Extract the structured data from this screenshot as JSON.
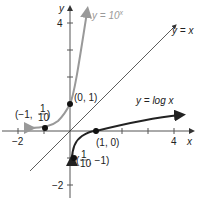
{
  "axes": {
    "x_label": "x",
    "y_label": "y",
    "x_ticks": [
      {
        "value": -2,
        "label": "−2"
      },
      {
        "value": 4,
        "label": "4"
      }
    ],
    "y_ticks": [
      {
        "value": 4,
        "label": "4"
      },
      {
        "value": -2,
        "label": "−2"
      }
    ],
    "xlim": [
      -2.5,
      5
    ],
    "ylim": [
      -2.5,
      4.6
    ]
  },
  "curves": [
    {
      "name": "exponential",
      "label": "y = 10^x",
      "label_base": "y = 10",
      "label_exp": "x",
      "color": "#999999"
    },
    {
      "name": "identity",
      "label": "y = x",
      "color": "#333333"
    },
    {
      "name": "logarithm",
      "label": "y = log x",
      "color": "#222222"
    }
  ],
  "points": [
    {
      "name": "exp-point-0-1",
      "label": "(0, 1)",
      "x": 0,
      "y": 1
    },
    {
      "name": "exp-point-neg1",
      "label_pre": "(−1,",
      "num": "1",
      "den": "10",
      "label_post": ")",
      "x": -1,
      "y": 0.1
    },
    {
      "name": "log-point-1-0",
      "label": "(1, 0)",
      "x": 1,
      "y": 0
    },
    {
      "name": "log-point-tenth",
      "label_pre": "(",
      "num": "1",
      "den": "10",
      "label_post": ", −1)",
      "x": 0.1,
      "y": -1
    }
  ]
}
